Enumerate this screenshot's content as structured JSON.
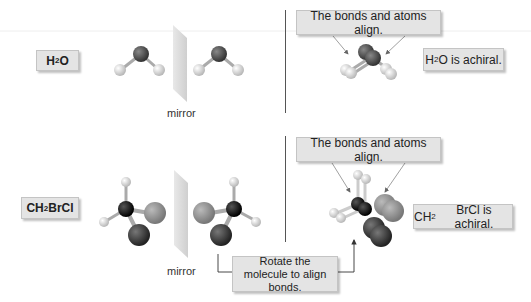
{
  "rows": [
    {
      "molecule_label": {
        "main": "H",
        "sub": "2",
        "rest": "O"
      },
      "mirror_label": "mirror",
      "align_note": "The bonds and atoms align.",
      "conclusion": {
        "pre": "H",
        "sub": "2",
        "rest": "O is achiral."
      }
    },
    {
      "molecule_label": {
        "main": "CH",
        "sub": "2",
        "rest": "BrCl"
      },
      "mirror_label": "mirror",
      "align_note": "The bonds and atoms align.",
      "conclusion": {
        "pre": "CH",
        "sub": "2",
        "rest": "BrCl is achiral."
      },
      "rotate_note": "Rotate the molecule to align bonds."
    }
  ],
  "colors": {
    "oxygen": "#555555",
    "hydrogen": "#e6e6e6",
    "carbon": "#111111",
    "bromine": "#3c3c3c",
    "chlorine": "#9a9a9a",
    "box_fill": "#e4e4e4",
    "mirror": "#d8d8d8"
  }
}
